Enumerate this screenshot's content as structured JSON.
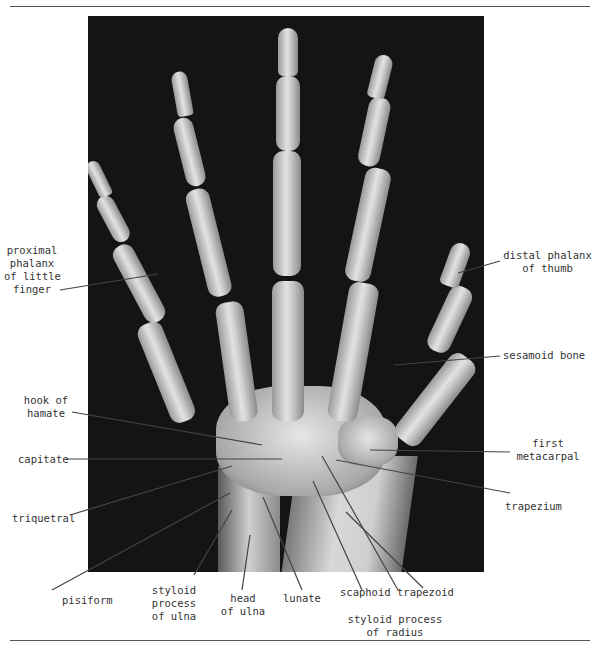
{
  "figure": {
    "type": "radiograph",
    "labels": {
      "proximal_phalanx": "proximal\nphalanx\nof little\nfinger",
      "distal_phalanx_thumb": "distal phalanx\nof thumb",
      "sesamoid": "sesamoid bone",
      "hook_hamate": "hook of\nhamate",
      "capitate": "capitate",
      "first_metacarpal": "first\nmetacarpal",
      "triquetral": "triquetral",
      "trapezium": "trapezium",
      "pisiform": "pisiform",
      "styloid_ulna": "styloid\nprocess\nof ulna",
      "head_ulna": "head\nof ulna",
      "lunate": "lunate",
      "scaphoid": "scaphoid",
      "trapezoid": "trapezoid",
      "styloid_radius": "styloid process\nof radius"
    }
  }
}
